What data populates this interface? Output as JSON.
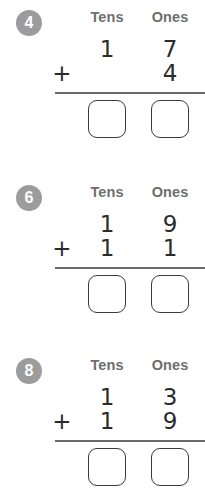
{
  "worksheet": {
    "column_headers": {
      "tens": "Tens",
      "ones": "Ones"
    },
    "operator": "+",
    "colors": {
      "badge_background": "#9c9c9c",
      "badge_text": "#ffffff",
      "header_text": "#6e6e6e",
      "digit_text": "#2b2b2b",
      "rule": "#6b6b6b",
      "box_border": "#3a3a3a",
      "page_background": "#ffffff"
    },
    "problems": [
      {
        "number": "4",
        "addend1": {
          "tens": "1",
          "ones": "7"
        },
        "addend2": {
          "tens": "",
          "ones": "4"
        },
        "answer": {
          "tens": "",
          "ones": ""
        }
      },
      {
        "number": "6",
        "addend1": {
          "tens": "1",
          "ones": "9"
        },
        "addend2": {
          "tens": "1",
          "ones": "1"
        },
        "answer": {
          "tens": "",
          "ones": ""
        }
      },
      {
        "number": "8",
        "addend1": {
          "tens": "1",
          "ones": "3"
        },
        "addend2": {
          "tens": "1",
          "ones": "9"
        },
        "answer": {
          "tens": "",
          "ones": ""
        }
      }
    ]
  }
}
